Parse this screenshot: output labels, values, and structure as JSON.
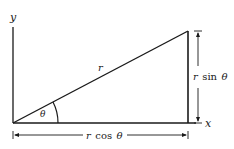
{
  "diagram": {
    "type": "polar-to-cartesian-triangle",
    "labels": {
      "y_axis": "y",
      "x_axis": "x",
      "hypotenuse": "r",
      "angle": "θ",
      "opposite_r": "r",
      "opposite_func": "sin",
      "opposite_theta": "θ",
      "adjacent_r": "r",
      "adjacent_func": "cos",
      "adjacent_theta": "θ"
    },
    "colors": {
      "stroke": "#1a1a1a",
      "background": "#ffffff"
    }
  }
}
